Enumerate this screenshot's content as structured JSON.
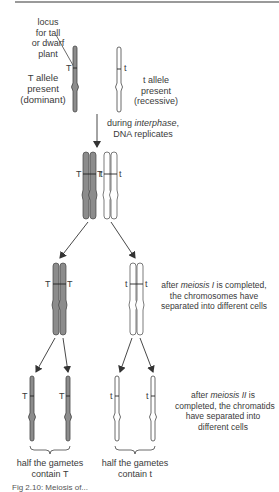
{
  "diagram": {
    "colors": {
      "dominant_fill": "#8c8c8c",
      "recessive_fill": "#ffffff",
      "outline": "#444444",
      "arrow": "#333333",
      "text": "#3a3a3a"
    },
    "labels": {
      "locus": [
        "locus",
        "for tall",
        "or dwarf",
        "plant"
      ],
      "t_dominant": [
        "T allele",
        "present",
        "(dominant)"
      ],
      "t_recessive": [
        "t allele",
        "present",
        "(recessive)"
      ],
      "interphase_pre": "during ",
      "interphase_em": "interphase",
      "interphase_post": ",",
      "interphase_line2": "DNA replicates",
      "meiosis1_pre": "after ",
      "meiosis1_em": "meiosis I",
      "meiosis1_post": " is completed,",
      "meiosis1_line2": "the chromosomes have",
      "meiosis1_line3": "separated into different cells",
      "meiosis2_pre": "after ",
      "meiosis2_em": "meiosis II",
      "meiosis2_post": " is",
      "meiosis2_line2": "completed, the chromatids",
      "meiosis2_line3": "have separated into",
      "meiosis2_line4": "different cells",
      "gametes_T": [
        "half the gametes",
        "contain T"
      ],
      "gametes_t": [
        "half the gametes",
        "contain t"
      ]
    },
    "alleles": {
      "dominant": "T",
      "recessive": "t"
    },
    "caption": "Fig 2.10: Meiosis of..."
  }
}
